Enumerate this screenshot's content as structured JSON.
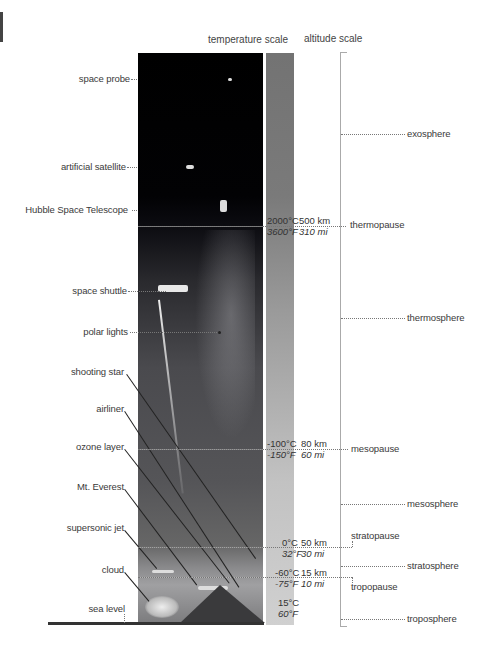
{
  "headers": {
    "temperature_scale": "temperature scale",
    "altitude_scale": "altitude scale"
  },
  "objects": [
    {
      "label": "space probe"
    },
    {
      "label": "artificial satellite"
    },
    {
      "label": "Hubble Space Telescope"
    },
    {
      "label": "space shuttle"
    },
    {
      "label": "polar lights"
    },
    {
      "label": "shooting star"
    },
    {
      "label": "airliner"
    },
    {
      "label": "ozone layer"
    },
    {
      "label": "Mt. Everest"
    },
    {
      "label": "supersonic jet"
    },
    {
      "label": "cloud"
    },
    {
      "label": "sea level"
    }
  ],
  "boundaries": [
    {
      "celsius": "2000°C",
      "fahrenheit": "3600°F",
      "km": "500 km",
      "mi": "310 mi",
      "name": "thermopause"
    },
    {
      "celsius": "-100°C",
      "fahrenheit": "-150°F",
      "km": "80 km",
      "mi": "60 mi",
      "name": "mesopause"
    },
    {
      "celsius": "0°C",
      "fahrenheit": "32°F",
      "km": "50 km",
      "mi": "30 mi",
      "name": "stratopause"
    },
    {
      "celsius": "-60°C",
      "fahrenheit": "-75°F",
      "km": "15 km",
      "mi": "10 mi",
      "name": "tropopause"
    },
    {
      "celsius": "15°C",
      "fahrenheit": "60°F"
    }
  ],
  "layers": [
    {
      "name": "exosphere"
    },
    {
      "name": "thermosphere"
    },
    {
      "name": "mesosphere"
    },
    {
      "name": "stratosphere"
    },
    {
      "name": "troposphere"
    }
  ]
}
